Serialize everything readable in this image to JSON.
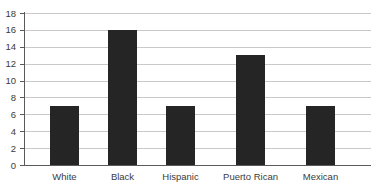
{
  "chart_data": {
    "type": "bar",
    "title": "",
    "subtitle": "",
    "xlabel": "",
    "ylabel": "",
    "categories": [
      "White",
      "Black",
      "Hispanic",
      "Puerto Rican",
      "Mexican"
    ],
    "values": [
      7,
      16,
      7,
      13,
      7
    ],
    "series": [
      {
        "name": "",
        "values": [
          7,
          16,
          7,
          13,
          7
        ]
      }
    ],
    "ylim": [
      0,
      18
    ],
    "ytick_labels": [
      "0",
      "2",
      "4",
      "6",
      "8",
      "10",
      "12",
      "14",
      "16",
      "18"
    ],
    "ytick_values": [
      0,
      2,
      4,
      6,
      8,
      10,
      12,
      14,
      16,
      18
    ],
    "grid": "horizontal",
    "legend": "none",
    "annotations": [],
    "bar_color": "#252525",
    "gridline_color": "#c9c9c9",
    "axis_color": "#5a5a5a",
    "label_color": "#3b3b3b",
    "background_color": "#ffffff"
  }
}
